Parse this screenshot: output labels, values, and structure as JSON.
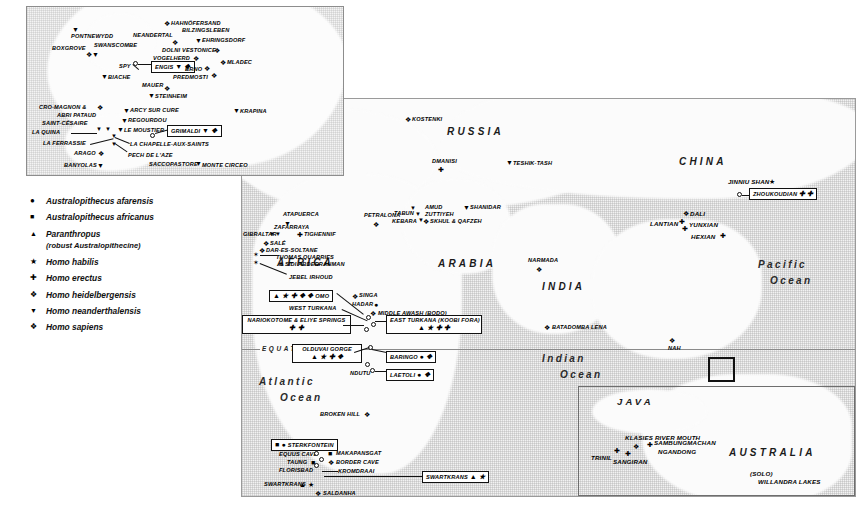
{
  "legend": {
    "items": [
      {
        "symbol": "●",
        "label": "Australopithecus afarensis"
      },
      {
        "symbol": "■",
        "label": "Australopithecus africanus"
      },
      {
        "symbol": "▲",
        "label": "Paranthropus",
        "sub": "(robust Australopithecine)"
      },
      {
        "symbol": "★",
        "label": "Homo habilis"
      },
      {
        "symbol": "✚",
        "label": "Homo erectus"
      },
      {
        "symbol": "❖",
        "label": "Homo heidelbergensis"
      },
      {
        "symbol": "▼",
        "label": "Homo neanderthalensis"
      },
      {
        "symbol": "❖",
        "label": "Homo sapiens"
      }
    ]
  },
  "regions": [
    {
      "name": "europe",
      "label": "EUROPE"
    },
    {
      "name": "russia",
      "label": "RUSSIA"
    },
    {
      "name": "china",
      "label": "CHINA"
    },
    {
      "name": "africa",
      "label": "AFRICA"
    },
    {
      "name": "arabia",
      "label": "ARABIA"
    },
    {
      "name": "india",
      "label": "INDIA"
    },
    {
      "name": "java",
      "label": "JAVA"
    },
    {
      "name": "australia",
      "label": "AUSTRALIA"
    }
  ],
  "oceans": [
    {
      "name": "pacific",
      "line1": "Pacific",
      "line2": "Ocean"
    },
    {
      "name": "atlantic",
      "line1": "Atlantic",
      "line2": "Ocean"
    },
    {
      "name": "indian",
      "line1": "Indian",
      "line2": "Ocean"
    }
  ],
  "equator": {
    "label": "EQUATOR"
  },
  "inset_sites": [
    {
      "label": "PONTNEWYDD",
      "sym": "▼"
    },
    {
      "label": "BOXGROVE",
      "sym": "❖▼"
    },
    {
      "label": "SWANSCOMBE",
      "sym": ""
    },
    {
      "label": "SPY",
      "sym": ""
    },
    {
      "label": "BIACHE",
      "sym": "▼"
    },
    {
      "label": "ENGIS",
      "sym": "▼ ❖"
    },
    {
      "label": "MAUER",
      "sym": "❖"
    },
    {
      "label": "STEINHEIM",
      "sym": "▼"
    },
    {
      "label": "NEANDERTAL",
      "sym": "❖"
    },
    {
      "label": "HAHNÖFERSAND",
      "sym": "❖"
    },
    {
      "label": "BILZINGSLEBEN",
      "sym": ""
    },
    {
      "label": "EHRINGSDORF",
      "sym": "▼"
    },
    {
      "label": "DOLNI VESTONICE",
      "sym": "❖"
    },
    {
      "label": "VOGELHERD",
      "sym": "❖"
    },
    {
      "label": "MLADEC",
      "sym": "❖"
    },
    {
      "label": "BRNO",
      "sym": "❖"
    },
    {
      "label": "PREDMOSTI",
      "sym": "❖"
    },
    {
      "label": "KRAPINA",
      "sym": "▼"
    },
    {
      "label": "CRO-MAGNON &",
      "sym": "❖"
    },
    {
      "label": "ABRI PATAUD",
      "sym": ""
    },
    {
      "label": "SAINT-CÉSAIRE",
      "sym": ""
    },
    {
      "label": "LA QUINA",
      "sym": ""
    },
    {
      "label": "LA FERRASSIE",
      "sym": ""
    },
    {
      "label": "ARAGO",
      "sym": "❖"
    },
    {
      "label": "BANYOLAS",
      "sym": "▼"
    },
    {
      "label": "ARCY SUR CURE",
      "sym": "▼"
    },
    {
      "label": "REGOURDOU",
      "sym": "▼"
    },
    {
      "label": "LE MOUSTIER",
      "sym": "▼"
    },
    {
      "label": "LA CHAPELLE-AUX-SAINTS",
      "sym": ""
    },
    {
      "label": "PECH DE L'AZE",
      "sym": ""
    },
    {
      "label": "SACCOPASTORE",
      "sym": "▼"
    },
    {
      "label": "MONTE CIRCEO",
      "sym": ""
    },
    {
      "label": "GRIMALDI",
      "sym": "▼ ❖"
    }
  ],
  "main_sites": [
    {
      "label": "ATAPUERCA",
      "sym": "▼"
    },
    {
      "label": "PETRALONA",
      "sym": "❖"
    },
    {
      "label": "GIBRALTAR",
      "sym": "▼▼"
    },
    {
      "label": "ZAFARRAYA",
      "sym": ""
    },
    {
      "label": "TIGHENNIF",
      "sym": "✚"
    },
    {
      "label": "SALÉ",
      "sym": "❖"
    },
    {
      "label": "DAR-ES-SOLTANE",
      "sym": "❖"
    },
    {
      "label": "THOMAS QUARRIES",
      "sym": ""
    },
    {
      "label": "& SIDI ABDERRAHMAN",
      "sym": ""
    },
    {
      "label": "JEBEL IRHOUD",
      "sym": ""
    },
    {
      "label": "KOSTENKI",
      "sym": "❖"
    },
    {
      "label": "DMANISI",
      "sym": "✚"
    },
    {
      "label": "TESHIK-TASH",
      "sym": "▼"
    },
    {
      "label": "AMUD",
      "sym": ""
    },
    {
      "label": "SHANIDAR",
      "sym": "▼"
    },
    {
      "label": "ZUTTIYEH",
      "sym": ""
    },
    {
      "label": "SKHUL & QAFZEH",
      "sym": "❖"
    },
    {
      "label": "TABUN",
      "sym": ""
    },
    {
      "label": "KEBARA",
      "sym": ""
    },
    {
      "label": "JINNIU SHAN",
      "sym": "★"
    },
    {
      "label": "ZHOUKOUDIAN",
      "sym": "✚ ✚"
    },
    {
      "label": "DALI",
      "sym": "❖"
    },
    {
      "label": "LANTIAN",
      "sym": "✚"
    },
    {
      "label": "YUNXIAN",
      "sym": "✚"
    },
    {
      "label": "HEXIAN",
      "sym": "✚"
    },
    {
      "label": "NARMADA",
      "sym": "❖"
    },
    {
      "label": "BATADOMBA LENA",
      "sym": "❖"
    },
    {
      "label": "NAH",
      "sym": "❖"
    },
    {
      "label": "SINGA",
      "sym": "❖"
    },
    {
      "label": "HADAR",
      "sym": "●"
    },
    {
      "label": "MIDDLE AWASH (BODO)",
      "sym": "❖"
    },
    {
      "label": "OMO",
      "sym": "▲ ★ ✚ ❖ ❖"
    },
    {
      "label": "WEST TURKANA",
      "sym": ""
    },
    {
      "label": "NARIOKOTOME & ELIYE SPRINGS",
      "sym": "✚ ✚"
    },
    {
      "label": "EAST TURKANA (KOOBI FORA)",
      "sym": "▲ ★ ✚ ✚"
    },
    {
      "label": "OLDUVAI GORGE",
      "sym": "▲ ★ ✚ ❖"
    },
    {
      "label": "BARINGO",
      "sym": "● ❖"
    },
    {
      "label": "LAETOLI",
      "sym": "● ❖"
    },
    {
      "label": "NDUTU",
      "sym": ""
    },
    {
      "label": "BROKEN HILL",
      "sym": "❖"
    },
    {
      "label": "STERKFONTEIN",
      "sym": "■ ●"
    },
    {
      "label": "MAKAPANSGAT",
      "sym": "■"
    },
    {
      "label": "EQUUS CAVE",
      "sym": ""
    },
    {
      "label": "BORDER CAVE",
      "sym": "❖"
    },
    {
      "label": "TAUNG",
      "sym": "■"
    },
    {
      "label": "FLORISBAD",
      "sym": ""
    },
    {
      "label": "KROMDRAAI",
      "sym": ""
    },
    {
      "label": "SWARTKRANS",
      "sym": "▲ ★"
    },
    {
      "label": "SALDANHA",
      "sym": "❖"
    },
    {
      "label": "KLASIES RIVER MOUTH",
      "sym": "❖"
    },
    {
      "label": "TRINIL",
      "sym": "✚"
    },
    {
      "label": "SANGIRAN",
      "sym": "✚"
    },
    {
      "label": "SAMBUNGMACHAN",
      "sym": "✚"
    },
    {
      "label": "NGANDONG",
      "sym": "✚"
    },
    {
      "label": "(SOLO)",
      "sym": ""
    },
    {
      "label": "WILLANDRA LAKES",
      "sym": ""
    },
    {
      "label": "& LAKE MUNGO",
      "sym": "❖"
    }
  ],
  "callouts": [
    {
      "name": "omo",
      "text": "OMO",
      "syms": "▲ ★ ✚ ❖ ❖"
    },
    {
      "name": "nariokotome",
      "text": "NARIOKOTOME & ELIYE SPRINGS",
      "syms": "✚ ✚"
    },
    {
      "name": "east-turkana",
      "text": "EAST TURKANA (KOOBI FORA)",
      "syms": "▲ ★ ✚ ✚"
    },
    {
      "name": "olduvai",
      "text": "OLDUVAI GORGE",
      "syms": "▲ ★ ✚ ❖"
    },
    {
      "name": "baringo",
      "text": "BARINGO",
      "syms": "● ❖"
    },
    {
      "name": "laetoli",
      "text": "LAETOLI",
      "syms": "● ❖"
    },
    {
      "name": "sterkfontein",
      "text": "STERKFONTEIN",
      "syms": "■ ●"
    },
    {
      "name": "swartkrans",
      "text": "SWARTKRANS",
      "syms": "▲ ★"
    },
    {
      "name": "zhoukoudian",
      "text": "ZHOUKOUDIAN",
      "syms": "✚ ✚"
    },
    {
      "name": "engis",
      "text": "ENGIS",
      "syms": "▼ ❖"
    },
    {
      "name": "grimaldi",
      "text": "GRIMALDI",
      "syms": "▼ ❖"
    }
  ]
}
